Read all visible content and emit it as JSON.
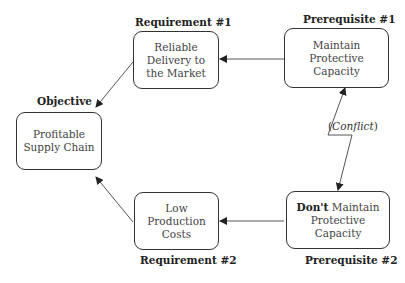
{
  "objective": {
    "label": "Objective",
    "text_line1": "Profitable",
    "text_line2": "Supply Chain"
  },
  "requirement1": {
    "label": "Requirement #1",
    "text_line1": "Reliable",
    "text_line2": "Delivery to",
    "text_line3": "the Market"
  },
  "requirement2": {
    "label": "Requirement #2",
    "text_line1": "Low",
    "text_line2": "Production",
    "text_line3": "Costs"
  },
  "prerequisite1": {
    "label": "Prerequisite #1",
    "text_line1": "Maintain",
    "text_line2": "Protective",
    "text_line3": "Capacity"
  },
  "prerequisite2": {
    "label": "Prerequisite #2",
    "text_bold": "Don't",
    "text_line1": " Maintain",
    "text_line2": "Protective",
    "text_line3": "Capacity"
  },
  "conflict": {
    "open": "(",
    "word": "Conflict",
    "close": ")"
  }
}
